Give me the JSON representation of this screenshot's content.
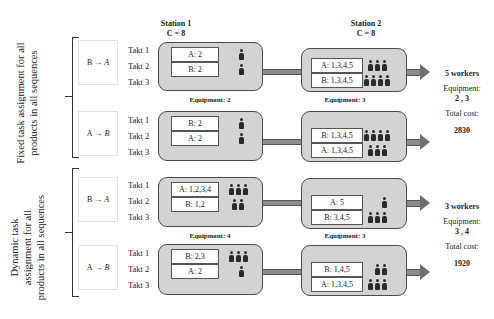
{
  "stations": [
    {
      "title": "Station 1",
      "cycle": "C = 8"
    },
    {
      "title": "Station 2",
      "cycle": "C = 8"
    }
  ],
  "groups": [
    {
      "label_line1": "Fixed task assignment for all",
      "label_line2": "products in all sequences",
      "summary": {
        "workers": "5 workers",
        "equipment_label": "Equipment:",
        "equipment_value": "2 , 3",
        "cost_label": "Total cost:",
        "cost_value": "2830"
      },
      "sequences": [
        {
          "seq_from": "B",
          "seq_to": "A",
          "arrow": "→",
          "takts": [
            "Takt 1",
            "Takt 2",
            "Takt 3"
          ],
          "station1": {
            "tasks": [
              "A: 2",
              "B: 2"
            ],
            "workers": [
              1,
              1
            ],
            "equipment": "Equipment: 2"
          },
          "station2": {
            "tasks": [
              "A: 1,3,4,5",
              "B: 1,3,4,5"
            ],
            "workers": [
              3,
              4
            ],
            "equipment": "Equipment: 3"
          }
        },
        {
          "seq_from": "A",
          "seq_to": "B",
          "arrow": "→",
          "takts": [
            "Takt 1",
            "Takt 2",
            "Takt 3"
          ],
          "station1": {
            "tasks": [
              "B: 2",
              "A: 2"
            ],
            "workers": [
              1,
              1
            ],
            "equipment": ""
          },
          "station2": {
            "tasks": [
              "B: 1,3,4,5",
              "A: 1,3,4,5"
            ],
            "workers": [
              4,
              3
            ],
            "equipment": ""
          }
        }
      ]
    },
    {
      "label_line1": "Dynamic task",
      "label_line2": "assignment for all",
      "label_line3": "products in all sequences",
      "summary": {
        "workers": "3 workers",
        "equipment_label": "Equipment:",
        "equipment_value": "3 , 4",
        "cost_label": "Total cost:",
        "cost_value": "1920"
      },
      "sequences": [
        {
          "seq_from": "B",
          "seq_to": "A",
          "arrow": "→",
          "takts": [
            "Takt 1",
            "Takt 2",
            "Takt 3"
          ],
          "station1": {
            "tasks": [
              "A: 1,2,3,4",
              "B: 1,2"
            ],
            "workers": [
              3,
              2
            ],
            "equipment": "Equipment: 4"
          },
          "station2": {
            "tasks": [
              "A: 5",
              "B: 3,4,5"
            ],
            "workers": [
              1,
              3
            ],
            "equipment": "Equipment: 3"
          }
        },
        {
          "seq_from": "A",
          "seq_to": "B",
          "arrow": "→",
          "takts": [
            "Takt 1",
            "Takt 2",
            "Takt 3"
          ],
          "station1": {
            "tasks": [
              "B: 2,3",
              "A: 2"
            ],
            "workers": [
              3,
              1
            ],
            "equipment": ""
          },
          "station2": {
            "tasks": [
              "B: 1,4,5",
              "A: 1,3,4,5"
            ],
            "workers": [
              2,
              3
            ],
            "equipment": ""
          }
        }
      ]
    }
  ]
}
